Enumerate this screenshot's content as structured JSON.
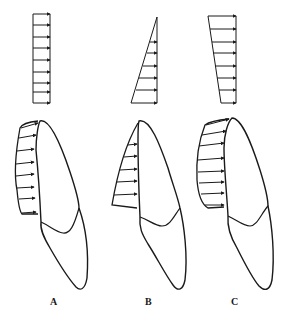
{
  "figure": {
    "panels": [
      {
        "label": "A",
        "pressure_distribution": "uniform (rectangular)"
      },
      {
        "label": "B",
        "pressure_distribution": "triangular (increasing toward cervical)"
      },
      {
        "label": "C",
        "pressure_distribution": "trapezoidal"
      }
    ],
    "stroke_color": "#1a1a1a",
    "background": "#ffffff"
  }
}
